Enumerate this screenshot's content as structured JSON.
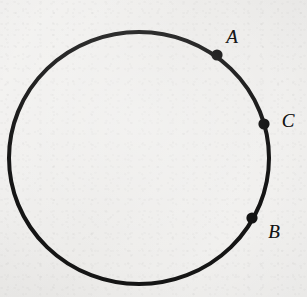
{
  "figure": {
    "name": "circle-with-three-points",
    "kind": "geometry-diagram",
    "width": 307,
    "height": 297,
    "background_color": "#f1f0ee",
    "ink_color": "#131313"
  },
  "circle": {
    "name": "circle-outline",
    "center_x": 139,
    "center_y": 158,
    "radius_x": 130,
    "radius_y": 126,
    "stroke_width": 4,
    "stroke_color": "#151515",
    "fill": "none"
  },
  "points": [
    {
      "id": "A",
      "label": "A",
      "dot_x": 217,
      "dot_y": 55,
      "dot_radius": 5.6,
      "label_x": 232,
      "label_y": 36,
      "label_font_size": 19,
      "color": "#131313"
    },
    {
      "id": "C",
      "label": "C",
      "dot_x": 264,
      "dot_y": 124,
      "dot_radius": 5.6,
      "label_x": 288,
      "label_y": 120,
      "label_font_size": 19,
      "color": "#131313"
    },
    {
      "id": "B",
      "label": "B",
      "dot_x": 252,
      "dot_y": 218,
      "dot_radius": 5.6,
      "label_x": 274,
      "label_y": 231,
      "label_font_size": 19,
      "color": "#131313"
    }
  ],
  "chart_data": {
    "type": "scatter",
    "title": "",
    "xlabel": "",
    "ylabel": "",
    "shapes": [
      {
        "type": "ellipse",
        "cx": 139,
        "cy": 158,
        "rx": 130,
        "ry": 126,
        "stroke": "#151515",
        "stroke_width": 4,
        "fill": "none"
      }
    ],
    "annotations": [
      {
        "text": "A",
        "x": 232,
        "y": 36,
        "italic": true
      },
      {
        "text": "C",
        "x": 288,
        "y": 120,
        "italic": true
      },
      {
        "text": "B",
        "x": 274,
        "y": 231,
        "italic": true
      }
    ],
    "points": [
      {
        "label": "A",
        "x": 217,
        "y": 55,
        "angle_deg": 52.3
      },
      {
        "label": "C",
        "x": 264,
        "y": 124,
        "angle_deg": 14.9
      },
      {
        "label": "B",
        "x": 252,
        "y": 218,
        "angle_deg": -26.4
      }
    ],
    "grid": false,
    "legend": "none"
  }
}
